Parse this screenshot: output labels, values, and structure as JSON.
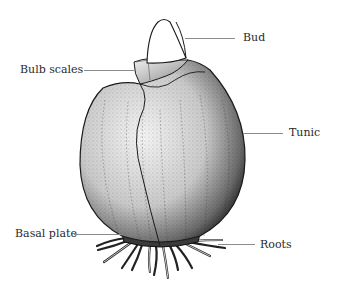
{
  "diagram": {
    "labels": [
      {
        "id": "bud",
        "text": "Bud"
      },
      {
        "id": "bulb-scales",
        "text": "Bulb scales"
      },
      {
        "id": "tunic",
        "text": "Tunic"
      },
      {
        "id": "basal-plate",
        "text": "Basal plate"
      },
      {
        "id": "roots",
        "text": "Roots"
      }
    ],
    "colors": {
      "ink": "#1a1a1a",
      "leader_line": "#8c8c8c",
      "background": "#ffffff"
    }
  }
}
